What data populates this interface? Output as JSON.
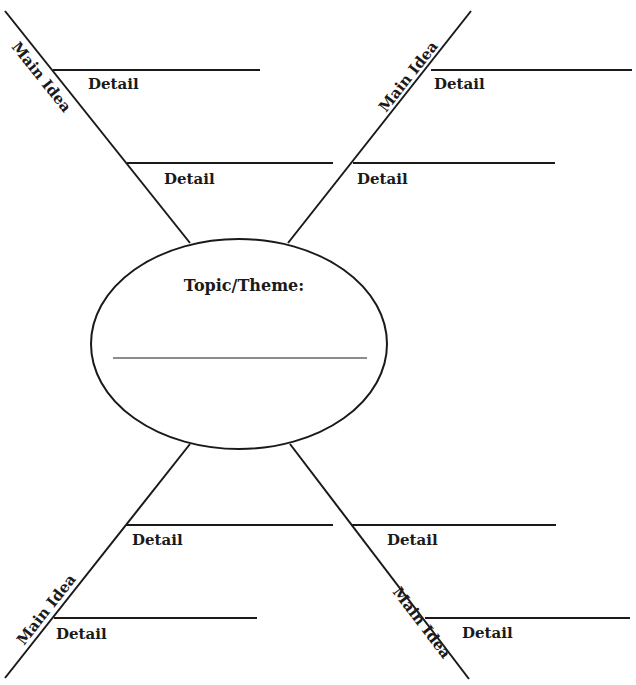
{
  "diagram": {
    "title_cutoff": "",
    "center": {
      "label": "Topic/Theme:",
      "answer_line_value": ""
    },
    "branches": [
      {
        "position": "top-left",
        "main_label": "Main Idea",
        "details": [
          {
            "label": "Detail",
            "value": ""
          },
          {
            "label": "Detail",
            "value": ""
          }
        ]
      },
      {
        "position": "top-right",
        "main_label": "Main Idea",
        "details": [
          {
            "label": "Detail",
            "value": ""
          },
          {
            "label": "Detail",
            "value": ""
          }
        ]
      },
      {
        "position": "bottom-left",
        "main_label": "Main Idea",
        "details": [
          {
            "label": "Detail",
            "value": ""
          },
          {
            "label": "Detail",
            "value": ""
          }
        ]
      },
      {
        "position": "bottom-right",
        "main_label": "Main Idea",
        "details": [
          {
            "label": "Detail",
            "value": ""
          },
          {
            "label": "Detail",
            "value": ""
          }
        ]
      }
    ],
    "colors": {
      "line": "#1a1a1a",
      "background": "#ffffff"
    }
  }
}
